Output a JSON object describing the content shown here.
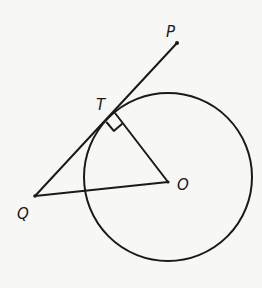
{
  "diagram": {
    "type": "geometry",
    "colors": {
      "background": "#f7f7f5",
      "stroke": "#1a1a1a"
    },
    "circle": {
      "center_label": "O",
      "cx": 168,
      "cy": 177,
      "r": 84
    },
    "points": {
      "P": {
        "label": "P",
        "x": 177,
        "y": 43,
        "label_x": 166,
        "label_y": 37
      },
      "T": {
        "label": "T",
        "x": 115,
        "y": 113,
        "label_x": 97,
        "label_y": 109
      },
      "Q": {
        "label": "Q",
        "x": 35,
        "y": 196,
        "label_x": 17,
        "label_y": 218
      },
      "O": {
        "label": "O",
        "x": 168,
        "y": 182,
        "label_x": 176,
        "label_y": 189
      }
    },
    "segments": [
      {
        "name": "QP",
        "from": "Q",
        "to": "P"
      },
      {
        "name": "TO",
        "from": "T",
        "to": "O"
      },
      {
        "name": "QO",
        "from": "Q",
        "to": "O"
      }
    ],
    "annotations": {
      "right_angle_at": "T",
      "right_angle_between": [
        "TP",
        "TO"
      ]
    }
  }
}
